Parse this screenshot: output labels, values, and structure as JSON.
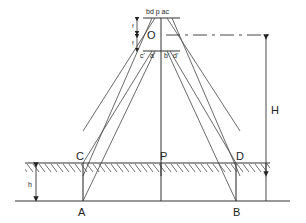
{
  "diagram": {
    "type": "aerial-photo-relief-displacement",
    "labels": {
      "lens_center": "O",
      "focal_top": "f",
      "focal_bottom": "f",
      "top_image_points": "bd p ac",
      "bottom_c": "c'",
      "bottom_a": "a'",
      "bottom_b": "b'",
      "bottom_d": "d'",
      "flying_height": "H",
      "object_height": "h",
      "point_C": "C",
      "point_P": "P",
      "point_D": "D",
      "point_A": "A",
      "point_B": "B"
    },
    "colors": {
      "line": "#333333",
      "background": "#ffffff"
    }
  }
}
